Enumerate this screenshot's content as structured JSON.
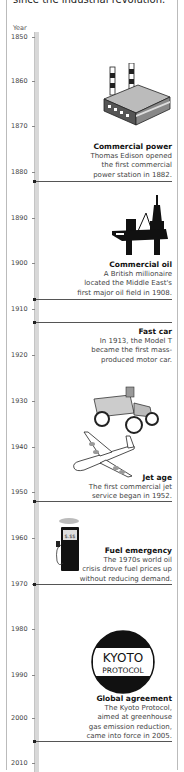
{
  "intro_text": "since the industrial revolution.",
  "axis": {
    "title": "Year",
    "ticks": [
      {
        "label": "1850",
        "y": 37
      },
      {
        "label": "1860",
        "y": 81
      },
      {
        "label": "1870",
        "y": 126
      },
      {
        "label": "1880",
        "y": 172
      },
      {
        "label": "1890",
        "y": 218
      },
      {
        "label": "1900",
        "y": 263
      },
      {
        "label": "1910",
        "y": 309
      },
      {
        "label": "1920",
        "y": 355
      },
      {
        "label": "1930",
        "y": 401
      },
      {
        "label": "1940",
        "y": 447
      },
      {
        "label": "1950",
        "y": 492
      },
      {
        "label": "1960",
        "y": 538
      },
      {
        "label": "1970",
        "y": 584
      },
      {
        "label": "1980",
        "y": 629
      },
      {
        "label": "1990",
        "y": 675
      },
      {
        "label": "2000",
        "y": 718
      },
      {
        "label": "2010",
        "y": 763
      }
    ]
  },
  "events": [
    {
      "year": 1882,
      "title": "Commercial power",
      "desc": [
        "Thomas Edison opened",
        "the first commercial",
        "power station in 1882."
      ],
      "icon": "power-station-icon"
    },
    {
      "year": 1908,
      "title": "Commercial oil",
      "desc": [
        "A British millionaire",
        "located the Middle East's",
        "first major oil field in 1908."
      ],
      "icon": "oil-rig-icon"
    },
    {
      "year": 1913,
      "title": "Fast car",
      "desc": [
        "In 1913, the Model T",
        "became the first mass-",
        "produced motor car."
      ],
      "icon": "model-t-car-icon"
    },
    {
      "year": 1952,
      "title": "Jet age",
      "desc": [
        "The first commercial jet",
        "service began in 1952."
      ],
      "icon": "jet-airplane-icon"
    },
    {
      "year": 1970,
      "title": "Fuel emergency",
      "desc": [
        "The 1970s world oil",
        "crisis drove fuel prices up",
        "without reducing demand."
      ],
      "icon": "fuel-pump-icon"
    },
    {
      "year": 2005,
      "title": "Global agreement",
      "desc": [
        "The Kyoto Protocol,",
        "aimed at greenhouse",
        "gas emission reduction,",
        "came into force in 2005."
      ],
      "icon": "kyoto-protocol-icon"
    }
  ],
  "kyoto_logo": {
    "line1": "KYOTO",
    "line2": "PROTOCOL"
  },
  "pump_display": "$.$$"
}
